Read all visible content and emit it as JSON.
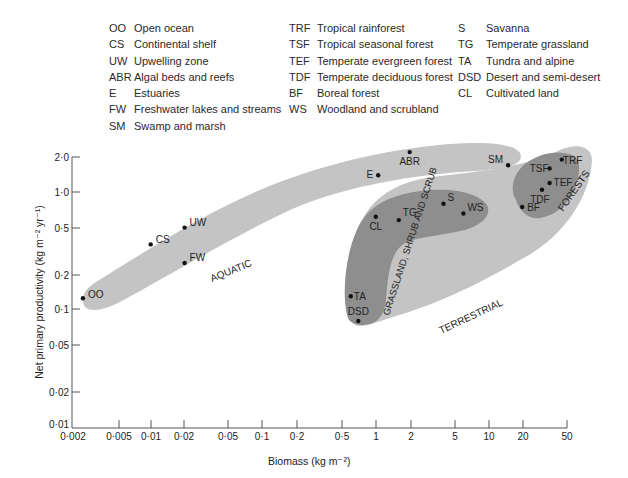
{
  "legend": {
    "column1": [
      {
        "abbr": "OO",
        "label": "Open ocean"
      },
      {
        "abbr": "CS",
        "label": "Continental shelf"
      },
      {
        "abbr": "UW",
        "label": "Upwelling zone"
      },
      {
        "abbr": "ABR",
        "label": "Algal beds and reefs"
      },
      {
        "abbr": "E",
        "label": "Estuaries"
      },
      {
        "abbr": "FW",
        "label": "Freshwater lakes and streams"
      },
      {
        "abbr": "SM",
        "label": "Swamp and marsh"
      }
    ],
    "column2": [
      {
        "abbr": "TRF",
        "label": "Tropical rainforest"
      },
      {
        "abbr": "TSF",
        "label": "Tropical seasonal forest"
      },
      {
        "abbr": "TEF",
        "label": "Temperate evergreen forest"
      },
      {
        "abbr": "TDF",
        "label": "Temperate deciduous forest"
      },
      {
        "abbr": "BF",
        "label": "Boreal forest"
      },
      {
        "abbr": "WS",
        "label": "Woodland and scrubland"
      }
    ],
    "column3": [
      {
        "abbr": "S",
        "label": "Savanna"
      },
      {
        "abbr": "TG",
        "label": "Temperate grassland"
      },
      {
        "abbr": "TA",
        "label": "Tundra and alpine"
      },
      {
        "abbr": "DSD",
        "label": "Desert and semi-desert"
      },
      {
        "abbr": "CL",
        "label": "Cultivated land"
      }
    ]
  },
  "chart_data": {
    "type": "scatter",
    "title": "",
    "xlabel": "Biomass (kg m⁻²)",
    "ylabel": "Net primary productivity (kg m⁻² yr⁻¹)",
    "xscale": "log",
    "yscale": "log",
    "xlim": [
      0.002,
      50
    ],
    "ylim": [
      0.01,
      2.0
    ],
    "x_ticks": [
      "0·002",
      "0·005",
      "0·01",
      "0·02",
      "0·05",
      "0·1",
      "0·2",
      "0·5",
      "1",
      "2",
      "5",
      "10",
      "20",
      "50"
    ],
    "y_ticks": [
      "2·0",
      "1·0",
      "0·5",
      "0·2",
      "0·1",
      "0·05",
      "0·02",
      "0·01"
    ],
    "grid": false,
    "legend_position": "top",
    "points": [
      {
        "label": "OO",
        "x": 0.0025,
        "y": 0.125,
        "group": "Aquatic"
      },
      {
        "label": "CS",
        "x": 0.01,
        "y": 0.36,
        "group": "Aquatic"
      },
      {
        "label": "UW",
        "x": 0.02,
        "y": 0.5,
        "group": "Aquatic"
      },
      {
        "label": "FW",
        "x": 0.02,
        "y": 0.25,
        "group": "Aquatic"
      },
      {
        "label": "E",
        "x": 1.05,
        "y": 1.4,
        "group": "Aquatic"
      },
      {
        "label": "ABR",
        "x": 2.0,
        "y": 2.2,
        "group": "Aquatic"
      },
      {
        "label": "SM",
        "x": 15,
        "y": 1.7,
        "group": "Aquatic"
      },
      {
        "label": "CL",
        "x": 1.0,
        "y": 0.62,
        "group": "Grassland, shrub and scrub"
      },
      {
        "label": "TG",
        "x": 1.6,
        "y": 0.58,
        "group": "Grassland, shrub and scrub"
      },
      {
        "label": "S",
        "x": 4.0,
        "y": 0.8,
        "group": "Grassland, shrub and scrub"
      },
      {
        "label": "WS",
        "x": 6.0,
        "y": 0.66,
        "group": "Grassland, shrub and scrub"
      },
      {
        "label": "TA",
        "x": 0.6,
        "y": 0.13,
        "group": "Grassland, shrub and scrub"
      },
      {
        "label": "DSD",
        "x": 0.7,
        "y": 0.08,
        "group": "Grassland, shrub and scrub"
      },
      {
        "label": "TRF",
        "x": 45,
        "y": 1.9,
        "group": "Forests"
      },
      {
        "label": "TSF",
        "x": 35,
        "y": 1.6,
        "group": "Forests"
      },
      {
        "label": "TEF",
        "x": 35,
        "y": 1.2,
        "group": "Forests"
      },
      {
        "label": "TDF",
        "x": 30,
        "y": 1.05,
        "group": "Forests"
      },
      {
        "label": "BF",
        "x": 20,
        "y": 0.75,
        "group": "Forests"
      }
    ],
    "regions": [
      {
        "name": "AQUATIC",
        "shade": "light"
      },
      {
        "name": "TERRESTRIAL",
        "shade": "light"
      },
      {
        "name": "GRASSLAND, SHRUB AND SCRUB",
        "shade": "dark"
      },
      {
        "name": "FORESTS",
        "shade": "dark"
      }
    ],
    "colors": {
      "light_region": "#c4c4c4",
      "dark_region": "#8e8e8e",
      "point": "#111111"
    }
  },
  "labels": {
    "aquatic": "AQUATIC",
    "terrestrial": "TERRESTRIAL",
    "grassland": "GRASSLAND, SHRUB AND SCRUB",
    "forests": "FORESTS"
  }
}
